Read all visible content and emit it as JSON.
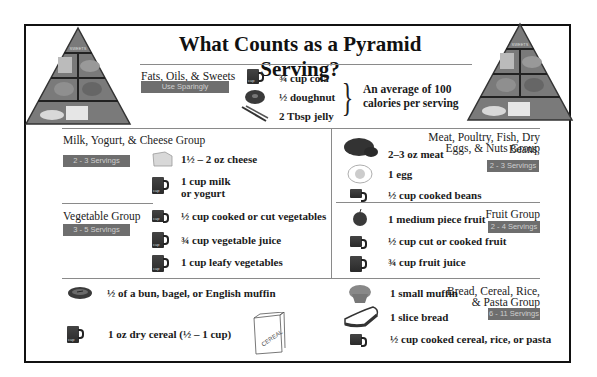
{
  "title": "What Counts as a Pyramid Serving?",
  "pyramid_icon": {
    "top_label": "SWEETS",
    "left": "food-pyramid-icon",
    "right": "food-pyramid-icon"
  },
  "fats": {
    "label": "Fats, Oils, & Sweets",
    "badge": "Use Sparingly",
    "items": [
      "¾ cup cola",
      "½ doughnut",
      "2 Tbsp jelly"
    ],
    "note_line1": "An average of 100",
    "note_line2": "calories per serving"
  },
  "milk": {
    "label": "Milk, Yogurt, & Cheese Group",
    "badge": "2 - 3 Servings",
    "items": [
      "1½  – 2 oz cheese",
      "1 cup milk",
      "or yogurt"
    ]
  },
  "meat": {
    "label_line1": "Meat, Poultry, Fish, Dry Beans,",
    "label_line2": "Eggs, & Nuts Group",
    "badge": "2 - 3 Servings",
    "items": [
      "2–3 oz meat",
      "1 egg",
      "½ cup cooked beans"
    ]
  },
  "vegetable": {
    "label": "Vegetable Group",
    "badge": "3 - 5 Servings",
    "items": [
      "½ cup cooked or cut vegetables",
      "¾ cup vegetable juice",
      "1 cup leafy vegetables"
    ]
  },
  "fruit": {
    "label": "Fruit Group",
    "badge": "2 - 4 Servings",
    "items": [
      "1 medium piece fruit",
      "½ cup cut or cooked fruit",
      "¾ cup fruit juice"
    ]
  },
  "bread": {
    "label_line1": "Bread, Cereal, Rice,",
    "label_line2": "& Pasta Group",
    "badge": "6 - 11 Servings",
    "left_items": [
      "½ of a bun, bagel, or English muffin",
      "1 oz dry cereal (½ – 1 cup)"
    ],
    "right_items": [
      "1 small muffin",
      "1 slice bread",
      "½ cup cooked cereal, rice, or pasta"
    ],
    "cereal_box_text": "CEREAL"
  },
  "cup_labels": {
    "quarter": "¾ cup",
    "half": "½ cup",
    "one": "1 cup",
    "cup": "cup"
  },
  "colors": {
    "badge_bg": "#6e6e6e",
    "badge_text": "#cfcfcf",
    "border": "#111111",
    "divider": "#8a8a8a"
  }
}
